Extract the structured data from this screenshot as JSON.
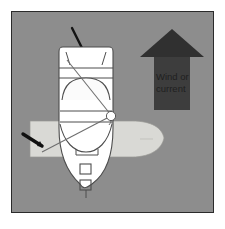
{
  "illustration": {
    "title": "Boat docking alongside a pier with wind or current from astern",
    "background_color": "#8d8d8d",
    "border_color": "#2b2b2b",
    "page_background": "#ffffff"
  },
  "wind_arrow": {
    "label_line1": "Wind or",
    "label_line2": "current",
    "direction": "up",
    "fill_color": "#3b3b3b",
    "head_fill_color": "#2e2e2e",
    "text_color": "#1f1f1f"
  },
  "dock": {
    "name": "dock",
    "fill_color": "#d8d8d4",
    "stroke_color": "#8f8f8b"
  },
  "boat": {
    "name": "boat",
    "hull_fill": "#ffffff",
    "outline_color": "#4a4a4a",
    "cabin_fill": "#f7f7f7",
    "hatch_count": 2,
    "antenna": "antenna",
    "fender_color": "#ffffff"
  },
  "mooring_line": {
    "name": "mooring-line",
    "color": "#6e6e6e"
  },
  "cleat_marker": {
    "name": "cleat-arrow",
    "color": "#101010"
  }
}
